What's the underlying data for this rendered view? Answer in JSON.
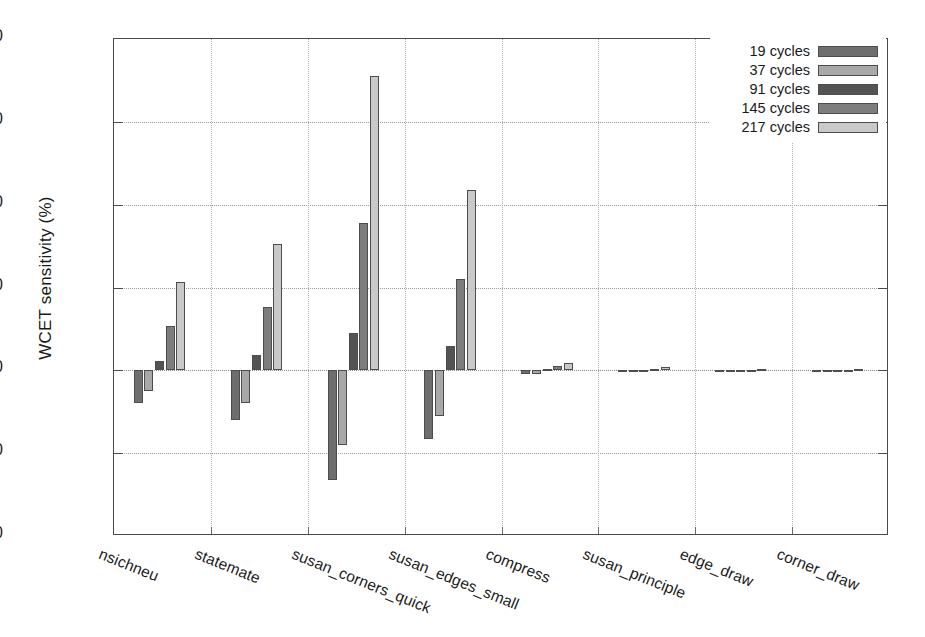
{
  "chart_data": {
    "type": "bar",
    "title": "",
    "xlabel": "",
    "ylabel": "WCET sensitivity (%)",
    "ylim": [
      -40,
      80
    ],
    "yticks": [
      -40,
      -20,
      0,
      20,
      40,
      60,
      80
    ],
    "ytick_labels": [
      "-40",
      "-20",
      "0",
      "20",
      "40",
      "60",
      "80"
    ],
    "grid": true,
    "legend_position": "top-right",
    "categories": [
      "nsichneu",
      "statemate",
      "susan_corners_quick",
      "susan_edges_small",
      "compress",
      "susan_principle",
      "edge_draw",
      "corner_draw"
    ],
    "series": [
      {
        "name": "19 cycles",
        "color": "#6e6e6e",
        "values": [
          -8.0,
          -12.0,
          -26.5,
          -16.5,
          -1.0,
          -0.4,
          -0.2,
          -0.2
        ]
      },
      {
        "name": "37 cycles",
        "color": "#a8a8a8",
        "values": [
          -5.0,
          -8.0,
          -18.0,
          -11.0,
          -0.8,
          -0.3,
          -0.2,
          -0.2
        ]
      },
      {
        "name": "91 cycles",
        "color": "#535353",
        "values": [
          2.2,
          3.8,
          9.0,
          5.8,
          0.4,
          0.2,
          0.1,
          0.1
        ]
      },
      {
        "name": "145 cycles",
        "color": "#7d7d7d",
        "values": [
          10.8,
          15.2,
          35.5,
          22.0,
          1.0,
          0.4,
          0.2,
          0.2
        ]
      },
      {
        "name": "217 cycles",
        "color": "#c9c9c9",
        "values": [
          21.3,
          30.5,
          71.0,
          43.5,
          1.8,
          0.8,
          0.3,
          0.3
        ]
      }
    ]
  },
  "axis": {
    "y_title": "WCET sensitivity (%)"
  },
  "legend": {
    "entries": [
      {
        "label": "19 cycles",
        "color": "#6e6e6e"
      },
      {
        "label": "37 cycles",
        "color": "#a8a8a8"
      },
      {
        "label": "91 cycles",
        "color": "#535353"
      },
      {
        "label": "145 cycles",
        "color": "#7d7d7d"
      },
      {
        "label": "217 cycles",
        "color": "#c9c9c9"
      }
    ]
  }
}
